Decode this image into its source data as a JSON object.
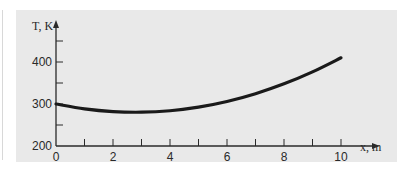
{
  "chart_data": {
    "type": "line",
    "title": "",
    "xlabel": "x, m",
    "ylabel": "T, K",
    "xlim": [
      0,
      10
    ],
    "ylim": [
      200,
      450
    ],
    "x_ticks_major": [
      0,
      2,
      4,
      6,
      8,
      10
    ],
    "x_ticks_minor": [
      1,
      3,
      5,
      7,
      9
    ],
    "y_ticks_major": [
      200,
      300,
      400
    ],
    "y_ticks_minor": [
      250,
      350,
      450
    ],
    "grid": false,
    "legend": null,
    "series": [
      {
        "name": "T(x)",
        "x": [
          0,
          1,
          2,
          3,
          4,
          5,
          6,
          7,
          8,
          9,
          10
        ],
        "values": [
          300,
          288.5,
          282,
          280.5,
          284,
          292.5,
          306,
          324.5,
          348,
          376.5,
          410
        ]
      }
    ]
  },
  "labels": {
    "y_axis": "T, K",
    "x_axis": "x, m",
    "x_ticks": [
      "0",
      "2",
      "4",
      "6",
      "8",
      "10"
    ],
    "y_ticks": [
      "200",
      "300",
      "400"
    ]
  },
  "colors": {
    "panel": "#e9e9e9",
    "curve": "#1a1a1a",
    "axis": "#2a2a2a"
  }
}
